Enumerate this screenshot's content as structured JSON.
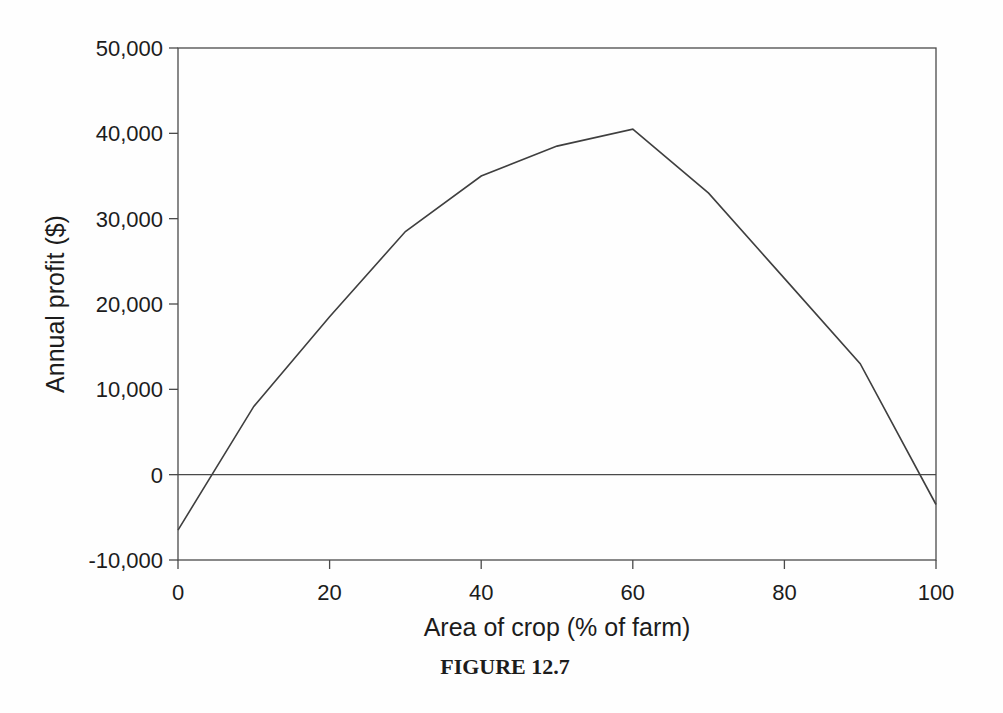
{
  "figure": {
    "caption": "FIGURE 12.7"
  },
  "chart_data": {
    "type": "line",
    "title": "",
    "xlabel": "Area of crop (% of farm)",
    "ylabel": "Annual profit ($)",
    "x": [
      0,
      10,
      20,
      30,
      40,
      50,
      60,
      70,
      80,
      90,
      100
    ],
    "y": [
      -6500,
      8000,
      18500,
      28500,
      35000,
      38500,
      40500,
      33000,
      23000,
      13000,
      -3500
    ],
    "xlim": [
      0,
      100
    ],
    "ylim": [
      -10000,
      50000
    ],
    "x_ticks": [
      0,
      20,
      40,
      60,
      80,
      100
    ],
    "x_tick_labels": [
      "0",
      "20",
      "40",
      "60",
      "80",
      "100"
    ],
    "y_ticks": [
      50000,
      40000,
      30000,
      20000,
      10000,
      0,
      -10000
    ],
    "y_tick_labels": [
      "50,000",
      "40,000",
      "30,000",
      "20,000",
      "10,000",
      "0",
      "-10,000"
    ],
    "grid": false,
    "legend": "none",
    "zero_line": true,
    "frame": true,
    "line_color": "#3f3f3f",
    "axis_color": "#4a4a4a",
    "text_color": "#1c1c1c",
    "background_color": "#fefefe"
  }
}
